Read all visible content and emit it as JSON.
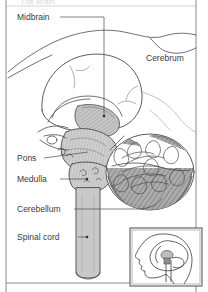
{
  "figure": {
    "title_cropped": "The Brain",
    "frame_color": "#8a8a8a",
    "background_color": "#ffffff",
    "line_color": "#3b3b3b",
    "label_color": "#3b3b3b",
    "shade_light": "#d9d9d9",
    "shade_mid": "#bdbdbd",
    "shade_dark": "#9a9a9a"
  },
  "labels": [
    {
      "id": "midbrain",
      "text": "Midbrain",
      "x": 17,
      "y": 20,
      "leader": "elbow-down"
    },
    {
      "id": "cerebrum",
      "text": "Cerebrum",
      "x": 146,
      "y": 61,
      "leader": "none"
    },
    {
      "id": "pons",
      "text": "Pons",
      "x": 17,
      "y": 161,
      "leader": "horizontal"
    },
    {
      "id": "medulla",
      "text": "Medulla",
      "x": 17,
      "y": 182,
      "leader": "horizontal"
    },
    {
      "id": "cerebellum",
      "text": "Cerebellum",
      "x": 17,
      "y": 212,
      "leader": "horizontal"
    },
    {
      "id": "spinal_cord",
      "text": "Spinal cord",
      "x": 17,
      "y": 240,
      "leader": "horizontal"
    }
  ],
  "inset": {
    "name": "head-orientation-inset",
    "description": "Side profile of a human head facing left with brain and brainstem shown in place",
    "x": 130,
    "y": 228,
    "width": 72,
    "height": 58
  }
}
